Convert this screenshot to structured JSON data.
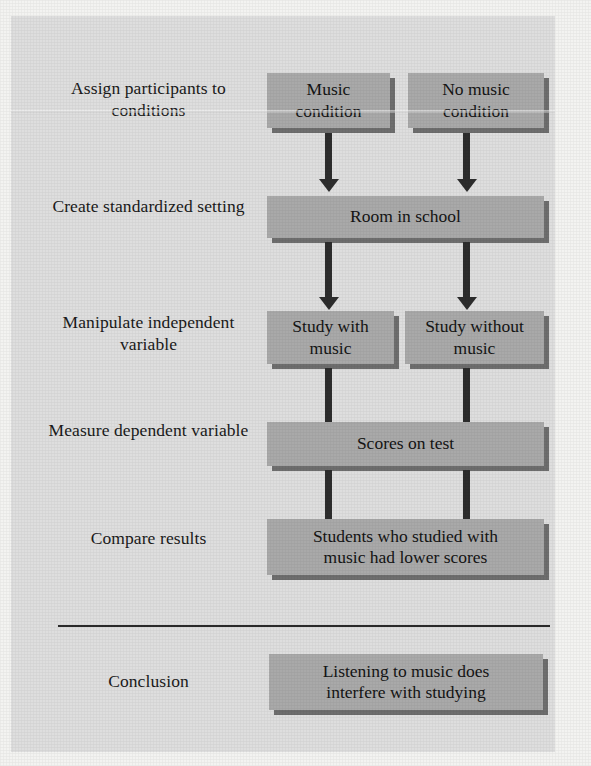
{
  "figure": {
    "panel_color": "#dedede",
    "box_color": "#a9a9a9",
    "box_shadow_color": "#6e6e6e",
    "arrow_color": "#2d2d2d",
    "text_color": "#141414"
  },
  "steps": [
    {
      "label": "Assign participants\nto conditions",
      "label_line1": "Assign participants",
      "label_line2": "to conditions",
      "boxes": [
        {
          "line1": "Music",
          "line2": "condition"
        },
        {
          "line1": "No music",
          "line2": "condition"
        }
      ]
    },
    {
      "label": "Create standardized\nsetting",
      "label_line1": "Create standardized",
      "label_line2": "setting",
      "boxes": [
        {
          "line1": "Room in school",
          "line2": ""
        }
      ]
    },
    {
      "label": "Manipulate\nindependent variable",
      "label_line1": "Manipulate",
      "label_line2": "independent variable",
      "boxes": [
        {
          "line1": "Study with",
          "line2": "music"
        },
        {
          "line1": "Study without",
          "line2": "music"
        }
      ]
    },
    {
      "label": "Measure\ndependent variable",
      "label_line1": "Measure",
      "label_line2": "dependent variable",
      "boxes": [
        {
          "line1": "Scores on test",
          "line2": ""
        }
      ]
    },
    {
      "label": "Compare results",
      "label_line1": "Compare results",
      "label_line2": "",
      "boxes": [
        {
          "line1": "Students who studied with",
          "line2": "music had lower scores"
        }
      ]
    },
    {
      "label": "Conclusion",
      "label_line1": "Conclusion",
      "label_line2": "",
      "boxes": [
        {
          "line1": "Listening to music does",
          "line2": "interfere with studying"
        }
      ]
    }
  ]
}
